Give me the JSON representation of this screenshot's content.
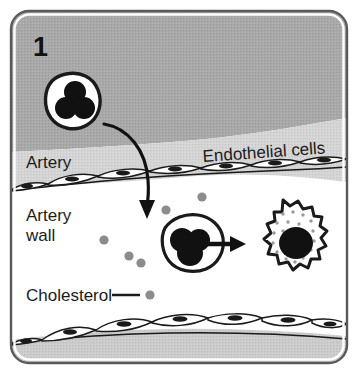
{
  "figure": {
    "panel_number": "1",
    "labels": {
      "artery": "Artery",
      "endothelial_cells": "Endothelial cells",
      "artery_wall_line1": "Artery",
      "artery_wall_line2": "wall",
      "cholesterol": "Cholesterol"
    },
    "colors": {
      "lumen_dark_gray": "#a8a8a8",
      "lumen_light_gray": "#d2d2d2",
      "wall_white": "#ffffff",
      "outline_black": "#1a1a1a",
      "cholesterol_gray": "#8c8c8c",
      "frame_border": "#5a5a5a",
      "page_background": "#ffffff",
      "bottom_band_gray": "#c9c9c9"
    },
    "elements": {
      "monocyte_free": "monocyte in lumen with trilobed nucleus",
      "monocyte_migrated": "monocyte inside artery wall",
      "foam_cell": "lipid-laden foam cell with round nucleus",
      "curved_arrow": "monocyte migrating across endothelium",
      "straight_arrow": "monocyte transforms into foam cell",
      "endothelium_top": "top endothelial cell layer",
      "endothelium_bottom": "bottom endothelial cell layer",
      "cholesterol_particles": "gray cholesterol dots in artery wall"
    }
  }
}
